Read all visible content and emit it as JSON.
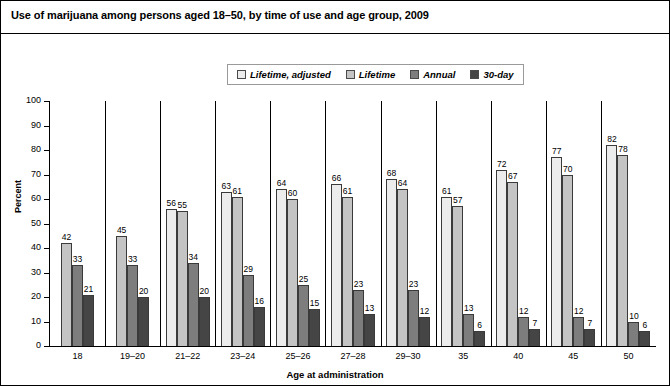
{
  "title": "Use of marijuana among persons aged 18–50, by time of use and age group, 2009",
  "legend": {
    "items": [
      {
        "label": "Lifetime, adjusted",
        "color": "#ececec"
      },
      {
        "label": "Lifetime",
        "color": "#c4c4c4"
      },
      {
        "label": "Annual",
        "color": "#7d7d7d"
      },
      {
        "label": "30-day",
        "color": "#454545"
      }
    ]
  },
  "axes": {
    "ylabel": "Percent",
    "xlabel": "Age at administration",
    "yticks": [
      0,
      10,
      20,
      30,
      40,
      50,
      60,
      70,
      80,
      90,
      100
    ]
  },
  "chart_data": {
    "type": "bar",
    "title": "Use of marijuana among persons aged 18–50, by time of use and age group, 2009",
    "xlabel": "Age at administration",
    "ylabel": "Percent",
    "ylim": [
      0,
      100
    ],
    "grid": false,
    "legend_position": "top-center",
    "categories": [
      "18",
      "19–20",
      "21–22",
      "23–24",
      "25–26",
      "27–28",
      "29–30",
      "35",
      "40",
      "45",
      "50"
    ],
    "series": [
      {
        "name": "Lifetime, adjusted",
        "color": "#ececec",
        "values": [
          null,
          null,
          56,
          63,
          64,
          66,
          68,
          61,
          72,
          77,
          82
        ]
      },
      {
        "name": "Lifetime",
        "color": "#c4c4c4",
        "values": [
          42,
          45,
          55,
          61,
          60,
          61,
          64,
          57,
          67,
          70,
          78
        ]
      },
      {
        "name": "Annual",
        "color": "#7d7d7d",
        "values": [
          33,
          33,
          34,
          29,
          25,
          23,
          23,
          13,
          12,
          12,
          10
        ]
      },
      {
        "name": "30-day",
        "color": "#454545",
        "values": [
          21,
          20,
          20,
          16,
          15,
          13,
          12,
          6,
          7,
          7,
          6
        ]
      }
    ]
  }
}
